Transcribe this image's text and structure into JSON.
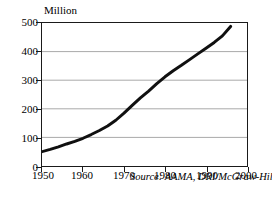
{
  "chart_data": {
    "type": "line",
    "title": "",
    "subtitle": "",
    "xlabel": "",
    "ylabel": "Million",
    "unit_label": "Million",
    "xlim": [
      1950,
      2000
    ],
    "ylim": [
      0,
      500
    ],
    "grid": true,
    "grid_axis": "y",
    "legend": false,
    "legend_position": "none",
    "annotations": [
      {
        "name": "source-note",
        "text": "Source: AAMA, DRI/McGraw-Hill",
        "style": "italic"
      }
    ],
    "xticks": [
      1950,
      1960,
      1970,
      1980,
      1990,
      2000
    ],
    "xtick_labels": [
      "1950",
      "1960",
      "1970",
      "1980",
      "1990",
      "2000"
    ],
    "yticks": [
      0,
      100,
      200,
      300,
      400,
      500
    ],
    "ytick_labels": [
      "0",
      "100",
      "200",
      "300",
      "400",
      "500"
    ],
    "series": [
      {
        "name": "registrations",
        "color": "#101010",
        "line_width": 3,
        "x": [
          1950,
          1952,
          1954,
          1956,
          1958,
          1960,
          1962,
          1964,
          1966,
          1968,
          1970,
          1972,
          1974,
          1976,
          1978,
          1980,
          1982,
          1984,
          1986,
          1988,
          1990,
          1992,
          1994,
          1996
        ],
        "values": [
          50,
          58,
          67,
          77,
          86,
          97,
          110,
          124,
          140,
          160,
          185,
          212,
          238,
          262,
          288,
          312,
          333,
          352,
          372,
          392,
          412,
          432,
          455,
          488
        ]
      }
    ]
  },
  "colors": {
    "axis": "#1a1a1a",
    "gridline": "#a8a8a8",
    "series": "#101010",
    "background": "#ffffff",
    "text": "#000000"
  }
}
